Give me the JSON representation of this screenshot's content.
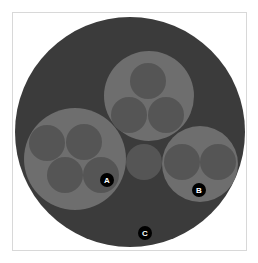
{
  "diagram": {
    "type": "circle-packing",
    "colors": {
      "background": "#ffffff",
      "frame_border": "#d8d8d8",
      "root_fill": "#3b3b3b",
      "group_fill": "#6e6e6e",
      "leaf_fill": "#555555",
      "label_fill": "#000000",
      "label_text": "#ffffff"
    },
    "root": {
      "cx": 130,
      "cy": 132,
      "r": 115
    },
    "groups": [
      {
        "id": "top-group",
        "cx": 149,
        "cy": 96,
        "r": 45,
        "leaves": [
          {
            "cx": 148,
            "cy": 81,
            "r": 18
          },
          {
            "cx": 129,
            "cy": 115,
            "r": 18
          },
          {
            "cx": 166,
            "cy": 115,
            "r": 18
          }
        ]
      },
      {
        "id": "left-group",
        "cx": 75,
        "cy": 159,
        "r": 51,
        "leaves": [
          {
            "cx": 47,
            "cy": 143,
            "r": 18
          },
          {
            "cx": 84,
            "cy": 142,
            "r": 18
          },
          {
            "cx": 65,
            "cy": 175,
            "r": 18
          },
          {
            "cx": 101,
            "cy": 175,
            "r": 18
          }
        ]
      },
      {
        "id": "right-group",
        "cx": 200,
        "cy": 164,
        "r": 38,
        "leaves": [
          {
            "cx": 182,
            "cy": 162,
            "r": 18
          },
          {
            "cx": 218,
            "cy": 162,
            "r": 18
          }
        ]
      }
    ],
    "lone_leaves": [
      {
        "cx": 144,
        "cy": 162,
        "r": 18
      }
    ],
    "labels": [
      {
        "text": "A",
        "cx": 107,
        "cy": 180,
        "r": 7
      },
      {
        "text": "B",
        "cx": 199,
        "cy": 190,
        "r": 7
      },
      {
        "text": "C",
        "cx": 145,
        "cy": 233,
        "r": 7
      }
    ]
  }
}
